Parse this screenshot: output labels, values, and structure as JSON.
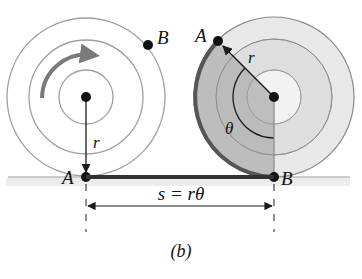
{
  "figure": {
    "caption": "(b)",
    "left_wheel": {
      "point_top_label": "B",
      "point_bottom_label": "A",
      "radius_label": "r",
      "rotation_direction": "clockwise"
    },
    "right_wheel": {
      "point_top_label": "A",
      "point_bottom_label": "B",
      "radius_label": "r",
      "angle_label": "θ"
    },
    "dimension": {
      "label": "s = rθ"
    },
    "colors": {
      "line": "#1a1a1a",
      "circle_stroke": "#9a9a9a",
      "wheel_light": "#e6e6e6",
      "wheel_inner": "#d4d4d4",
      "wedge_shade": "#b8b8b8",
      "ground_strip": "#ececec",
      "arrow_gray": "#7a7a7a"
    }
  }
}
